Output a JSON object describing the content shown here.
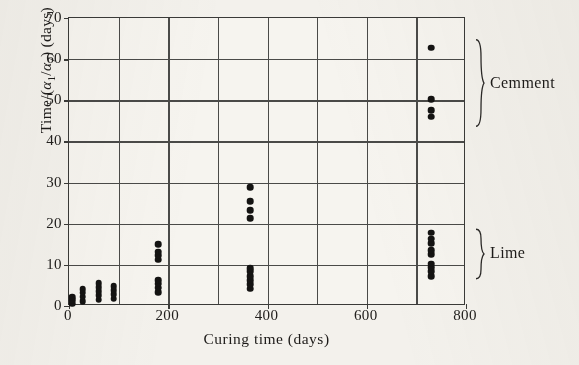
{
  "chart_data": {
    "type": "scatter",
    "title": "",
    "xlabel": "Curing time (days)",
    "ylabel_html": "Time/(&alpha;<sub>1</sub>/&alpha;<sub>7</sub>) (days)",
    "ylabel_text": "Time/(a1/a7) (days)",
    "xlim": [
      0,
      800
    ],
    "ylim": [
      0,
      70
    ],
    "xticks": [
      0,
      200,
      400,
      600,
      800
    ],
    "yticks": [
      0,
      10,
      20,
      30,
      40,
      50,
      60,
      70
    ],
    "x_gridlines": [
      0,
      100,
      200,
      300,
      400,
      500,
      600,
      700,
      800
    ],
    "y_gridlines": [
      0,
      10,
      20,
      30,
      40,
      50,
      60,
      70
    ],
    "grid": true,
    "legend_position": "right-outside-braces",
    "series": [
      {
        "name": "Lime",
        "points": [
          [
            7,
            0.6
          ],
          [
            7,
            1.4
          ],
          [
            7,
            2.2
          ],
          [
            28,
            1.2
          ],
          [
            28,
            2.3
          ],
          [
            28,
            3.2
          ],
          [
            28,
            4.1
          ],
          [
            60,
            1.5
          ],
          [
            60,
            2.6
          ],
          [
            60,
            3.6
          ],
          [
            60,
            4.5
          ],
          [
            60,
            5.6
          ],
          [
            90,
            1.8
          ],
          [
            90,
            2.8
          ],
          [
            90,
            3.8
          ],
          [
            90,
            4.8
          ],
          [
            180,
            3.4
          ],
          [
            180,
            4.4
          ],
          [
            180,
            5.4
          ],
          [
            180,
            6.2
          ],
          [
            180,
            11.3
          ],
          [
            180,
            12.3
          ],
          [
            180,
            13.2
          ],
          [
            180,
            15.0
          ],
          [
            365,
            4.2
          ],
          [
            365,
            5.3
          ],
          [
            365,
            6.3
          ],
          [
            365,
            7.3
          ],
          [
            365,
            8.4
          ],
          [
            365,
            9.2
          ],
          [
            730,
            7.3
          ],
          [
            730,
            8.4
          ],
          [
            730,
            9.4
          ],
          [
            730,
            10.3
          ],
          [
            730,
            12.6
          ],
          [
            730,
            13.6
          ],
          [
            730,
            15.2
          ],
          [
            730,
            16.4
          ],
          [
            730,
            17.8
          ]
        ]
      },
      {
        "name": "Cemment",
        "points": [
          [
            365,
            21.3
          ],
          [
            365,
            23.3
          ],
          [
            365,
            25.4
          ],
          [
            365,
            28.9
          ],
          [
            730,
            46.0
          ],
          [
            730,
            47.6
          ],
          [
            730,
            50.2
          ],
          [
            730,
            62.8
          ]
        ]
      }
    ],
    "annotations": [
      {
        "label": "Cemment",
        "brace": "right-curly-brace",
        "y_range": [
          43,
          65
        ]
      },
      {
        "label": "Lime",
        "brace": "right-curly-brace",
        "y_range": [
          6,
          19
        ]
      }
    ]
  },
  "colors": {
    "background": "#f3f1ec",
    "plot_background": "#f6f4ef",
    "axis": "#3a3a38",
    "grid": "#4a4a48",
    "marker": "#141312",
    "text": "#1d1b19"
  }
}
